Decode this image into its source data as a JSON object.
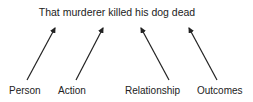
{
  "sentence": "That murderer killed his dog dead",
  "labels": [
    {
      "text": "Person"
    },
    {
      "text": "Action"
    },
    {
      "text": "Relationship"
    },
    {
      "text": "Outcomes"
    }
  ],
  "colors": {
    "arrow": "#222222",
    "text": "#222222",
    "background": "#ffffff"
  }
}
